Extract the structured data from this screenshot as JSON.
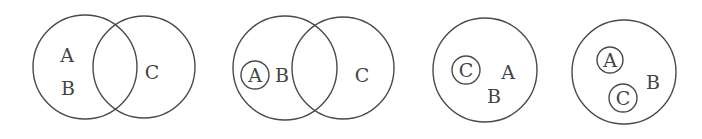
{
  "diagrams": [
    {
      "id": "venn-1",
      "circles": [
        {
          "cx": 85,
          "cy": 67,
          "r": 52
        },
        {
          "cx": 144,
          "cy": 67,
          "r": 51
        }
      ],
      "labels": [
        {
          "text": "A",
          "x": 67,
          "y": 55
        },
        {
          "text": "B",
          "x": 68,
          "y": 88
        },
        {
          "text": "C",
          "x": 152,
          "y": 72
        }
      ]
    },
    {
      "id": "venn-2",
      "circles": [
        {
          "cx": 285,
          "cy": 68,
          "r": 52
        },
        {
          "cx": 343,
          "cy": 68,
          "r": 51
        },
        {
          "cx": 255,
          "cy": 75,
          "r": 14
        }
      ],
      "labels": [
        {
          "text": "A",
          "x": 255,
          "y": 75
        },
        {
          "text": "B",
          "x": 282,
          "y": 75
        },
        {
          "text": "C",
          "x": 362,
          "y": 75
        }
      ]
    },
    {
      "id": "venn-3",
      "circles": [
        {
          "cx": 485,
          "cy": 70,
          "r": 52
        },
        {
          "cx": 466,
          "cy": 70,
          "r": 14
        }
      ],
      "labels": [
        {
          "text": "C",
          "x": 466,
          "y": 70
        },
        {
          "text": "A",
          "x": 508,
          "y": 72
        },
        {
          "text": "B",
          "x": 494,
          "y": 96
        }
      ]
    },
    {
      "id": "venn-4",
      "circles": [
        {
          "cx": 624,
          "cy": 72,
          "r": 52
        },
        {
          "cx": 610,
          "cy": 60,
          "r": 13
        },
        {
          "cx": 623,
          "cy": 98,
          "r": 14
        }
      ],
      "labels": [
        {
          "text": "A",
          "x": 610,
          "y": 60
        },
        {
          "text": "C",
          "x": 623,
          "y": 98
        },
        {
          "text": "B",
          "x": 653,
          "y": 82
        }
      ]
    }
  ],
  "colors": {
    "stroke": "#4a4a4a",
    "text": "#444444",
    "background": "#ffffff"
  }
}
